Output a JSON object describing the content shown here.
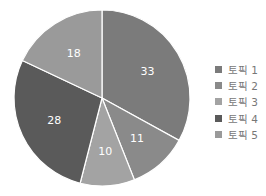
{
  "chart_data": {
    "type": "pie",
    "title": "",
    "categories": [
      "토픽 1",
      "토픽 2",
      "토픽 3",
      "토픽 4",
      "토픽 5"
    ],
    "values": [
      33,
      11,
      10,
      28,
      18
    ],
    "colors": [
      "#7b7b7b",
      "#8a8a8a",
      "#a3a3a3",
      "#5a5a5a",
      "#9a9a9a"
    ],
    "start_angle": "12 o'clock, clockwise",
    "legend_position": "right"
  }
}
